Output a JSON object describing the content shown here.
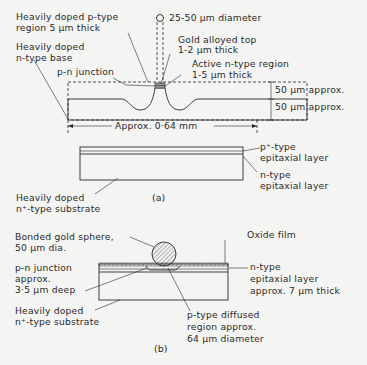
{
  "figure_a": {
    "caption": "(a)",
    "labels": {
      "p_type_region_1": "Heavily doped p-type",
      "p_type_region_2": "region 5 µm thick",
      "n_type_base_1": "Heavily doped",
      "n_type_base_2": "n-type base",
      "pn_junction": "p-n junction",
      "diameter": "25-50 µm diameter",
      "gold_top_1": "Gold alloyed top",
      "gold_top_2": "1-2 µm thick",
      "active_region_1": "Active n-type region",
      "active_region_2": "1-5 µm thick",
      "dim_upper": "50 µm approx.",
      "dim_lower": "50 µm approx.",
      "width_dim": "Approx. 0·64 mm",
      "p_plus_layer_1": "p⁺-type",
      "p_plus_layer_2": "epitaxial layer",
      "n_layer_1": "n-type",
      "n_layer_2": "epitaxial layer",
      "substrate_1": "Heavily doped",
      "substrate_2": "n⁺-type substrate"
    }
  },
  "figure_b": {
    "caption": "(b)",
    "labels": {
      "gold_sphere_1": "Bonded gold sphere,",
      "gold_sphere_2": "50 µm dia.",
      "oxide": "Oxide film",
      "pn_junction_1": "p-n junction",
      "pn_junction_2": "approx.",
      "pn_junction_3": "3·5 µm deep",
      "n_epi_1": "n-type",
      "n_epi_2": "epitaxial layer",
      "n_epi_3": "approx. 7 µm thick",
      "substrate_1": "Heavily doped",
      "substrate_2": "n⁺-type substrate",
      "p_diffused_1": "p-type diffused",
      "p_diffused_2": "region approx.",
      "p_diffused_3": "64 µm diameter"
    }
  }
}
